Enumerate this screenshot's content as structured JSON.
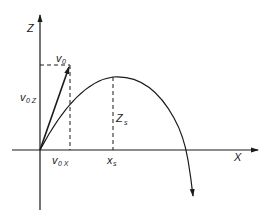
{
  "diagram": {
    "type": "projectile-trajectory",
    "colors": {
      "ink": "#1a1a1a",
      "background": "#ffffff"
    },
    "axes": {
      "z": {
        "label": "Z"
      },
      "x": {
        "label": "X"
      }
    },
    "labels": {
      "v0": {
        "main": "v",
        "sub": "0"
      },
      "v0z": {
        "main": "v",
        "sub": "0 Z"
      },
      "v0x": {
        "main": "v",
        "sub": "0 X"
      },
      "zs": {
        "main": "Z",
        "sub": "s"
      },
      "xs": {
        "main": "x",
        "sub": "s"
      }
    }
  }
}
